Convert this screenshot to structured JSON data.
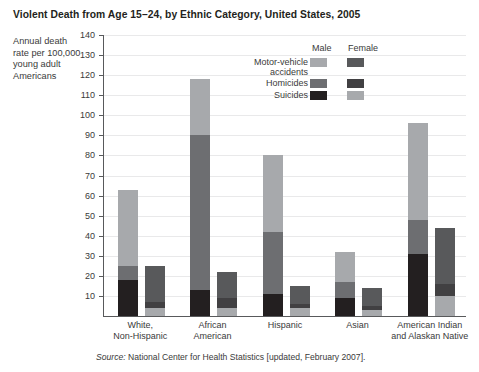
{
  "title": "Violent Death from Age 15–24, by Ethnic Category, United States, 2005",
  "axis_label_text": "Annual death rate per 100,000 young adult Americans",
  "source": {
    "prefix": "Source:",
    "text": " National Center for Health Statistics [updated, February 2007]."
  },
  "legend": {
    "male_header": "Male",
    "female_header": "Female",
    "items": [
      {
        "label_line1": "Motor-vehicle",
        "label_line2": "accidents",
        "male_color": "#a7a9ac",
        "female_color": "#58595b"
      },
      {
        "label_line1": "Homicides",
        "label_line2": "",
        "male_color": "#6d6e71",
        "female_color": "#414042"
      },
      {
        "label_line1": "Suicides",
        "label_line2": "",
        "male_color": "#231f20",
        "female_color": "#a7a9ac"
      }
    ]
  },
  "colors": {
    "male_motor_vehicle": "#a7a9ac",
    "male_homicides": "#6d6e71",
    "male_suicides": "#231f20",
    "female_motor_vehicle": "#58595b",
    "female_homicides": "#414042",
    "female_suicides": "#a7a9ac",
    "axis": "#58595b",
    "gridline": "#e9e9ea",
    "text": "#3a3a3a"
  },
  "chart_data": {
    "type": "bar",
    "subtype": "stacked-grouped",
    "title": "Violent Death from Age 15–24, by Ethnic Category, United States, 2005",
    "xlabel": "",
    "ylabel": "Annual death rate per 100,000 young adult Americans",
    "ylim": [
      0,
      140
    ],
    "yticks": [
      10,
      20,
      30,
      40,
      50,
      60,
      70,
      80,
      90,
      100,
      110,
      120,
      130,
      140
    ],
    "ytick_labels": [
      "10",
      "20",
      "30",
      "40",
      "50",
      "60",
      "70",
      "80",
      "90",
      "100",
      "110",
      "120",
      "130",
      "140"
    ],
    "grid": true,
    "legend_position": "top-center",
    "stack_order": [
      "Suicides",
      "Homicides",
      "Motor-vehicle accidents"
    ],
    "categories": [
      {
        "line1": "White,",
        "line2": "Non-Hispanic"
      },
      {
        "line1": "African",
        "line2": "American"
      },
      {
        "line1": "Hispanic",
        "line2": ""
      },
      {
        "line1": "Asian",
        "line2": ""
      },
      {
        "line1": "American Indian",
        "line2": "and Alaskan Native"
      }
    ],
    "category_labels": [
      "White, Non-Hispanic",
      "African American",
      "Hispanic",
      "Asian",
      "American Indian and Alaskan Native"
    ],
    "series": [
      {
        "name": "Male",
        "stacks": [
          {
            "name": "Suicides",
            "values": [
              18,
              13,
              11,
              9,
              31
            ]
          },
          {
            "name": "Homicides",
            "values": [
              7,
              77,
              31,
              8,
              17
            ]
          },
          {
            "name": "Motor-vehicle accidents",
            "values": [
              38,
              28,
              38,
              15,
              48
            ]
          }
        ],
        "totals": [
          63,
          118,
          80,
          32,
          96
        ]
      },
      {
        "name": "Female",
        "stacks": [
          {
            "name": "Suicides",
            "values": [
              4,
              4,
              4,
              3,
              10
            ]
          },
          {
            "name": "Homicides",
            "values": [
              3,
              5,
              2,
              2,
              6
            ]
          },
          {
            "name": "Motor-vehicle accidents",
            "values": [
              18,
              13,
              9,
              9,
              28
            ]
          }
        ],
        "totals": [
          25,
          22,
          15,
          14,
          44
        ]
      }
    ]
  }
}
